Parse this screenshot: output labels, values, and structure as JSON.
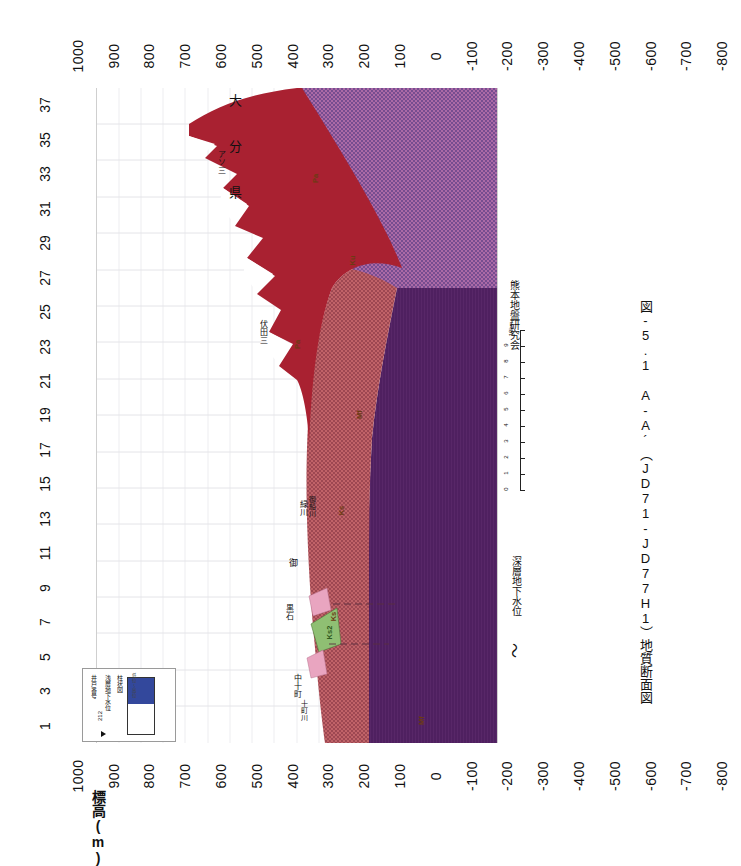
{
  "figure": {
    "caption": "図-5.1  A-A´（JD71-JD77H1）地質断面図",
    "organization": "熊本地盤研究会",
    "prefecture_label": "大 分 県",
    "y_axis_title": "標高(m)",
    "groundwater_label": "深層地下水位",
    "groundwater_symbol": "〜"
  },
  "chart_data": {
    "type": "area",
    "title": "図-5.1  A-A´（JD71-JD77H1）地質断面図",
    "xlabel": "",
    "ylabel": "標高(m)",
    "ylim": [
      -800,
      1000
    ],
    "xlim": [
      1,
      37
    ],
    "grid": true,
    "legend_position": "inside-lower-left",
    "x_tick_labels": [
      "1",
      "3",
      "5",
      "7",
      "9",
      "11",
      "13",
      "15",
      "17",
      "19",
      "21",
      "23",
      "25",
      "27",
      "29",
      "31",
      "33",
      "35",
      "37"
    ],
    "y_tick_labels": [
      "1000",
      "900",
      "800",
      "700",
      "600",
      "500",
      "400",
      "300",
      "200",
      "100",
      "0",
      "-100",
      "-200",
      "-300",
      "-400",
      "-500",
      "-600",
      "-700",
      "-800"
    ],
    "series": [
      {
        "name": "ground-surface",
        "note": "地表面（標高プロファイル）",
        "x": [
          1,
          2,
          3,
          4,
          5,
          6,
          7,
          8,
          9,
          10,
          11,
          12,
          13,
          14,
          15,
          16,
          17,
          18,
          19,
          20,
          21,
          22,
          23,
          24,
          25,
          26,
          27,
          28
        ],
        "values": [
          35,
          60,
          95,
          120,
          150,
          120,
          95,
          200,
          260,
          210,
          175,
          240,
          330,
          300,
          260,
          320,
          380,
          340,
          300,
          330,
          430,
          400,
          350,
          430,
          480,
          420,
          640,
          720
        ]
      },
      {
        "name": "Ks-base",
        "note": "砥川溶岩／阿蘇火砕流下限",
        "x": [
          1,
          4,
          7,
          10,
          13,
          16,
          19,
          22,
          25,
          27
        ],
        "values": [
          -180,
          -200,
          -205,
          -195,
          -160,
          -100,
          -20,
          120,
          330,
          560
        ]
      },
      {
        "name": "basement-top",
        "note": "基盤岩上面",
        "x": [
          1,
          5,
          9,
          13,
          16,
          19,
          22,
          25,
          27
        ],
        "values": [
          -230,
          -235,
          -230,
          -210,
          -150,
          -40,
          140,
          360,
          600
        ]
      }
    ],
    "units": [
      {
        "code": "Ks",
        "color": "#bb5a5e",
        "pattern": "dots",
        "description": "阿蘇火砕流堆積物"
      },
      {
        "code": "Ku",
        "color": "#a6609e",
        "pattern": "dots",
        "description": "上位層"
      },
      {
        "code": "Pa",
        "color": "#a92131",
        "pattern": "solid",
        "description": "先阿蘇火山岩類"
      },
      {
        "code": "Mf",
        "color": "#4f2060",
        "pattern": "hatch",
        "description": "基盤岩"
      },
      {
        "code": "Ks2",
        "color": "#8fbf73",
        "pattern": "solid",
        "description": "砥川溶岩"
      },
      {
        "code": "Ah",
        "color": "#e9a5c0",
        "pattern": "solid",
        "description": "沖積層"
      }
    ],
    "annotations": [
      {
        "text": "大 分 県",
        "x": 24,
        "y": 760
      },
      {
        "text": "阿蘇三",
        "x": 24.5,
        "y": 415
      },
      {
        "text": "伏田三",
        "x": 17.6,
        "y": 300
      },
      {
        "text": "緑川",
        "x": 8.9,
        "y": 120
      },
      {
        "text": "御船川",
        "x": 8.4,
        "y": 105
      },
      {
        "text": "御",
        "x": 7.2,
        "y": 70
      },
      {
        "text": "黒石",
        "x": 5.3,
        "y": 110
      },
      {
        "text": "中十町",
        "x": 3.1,
        "y": 70
      },
      {
        "text": "十町川",
        "x": 2.4,
        "y": 55
      },
      {
        "text": "Pa",
        "x": 24.0,
        "y": 390
      },
      {
        "text": "Pa",
        "x": 17.0,
        "y": 265
      },
      {
        "text": "Ku",
        "x": 21.5,
        "y": 30
      },
      {
        "text": "Mf",
        "x": 14.5,
        "y": -60
      },
      {
        "text": "Ks",
        "x": 9.6,
        "y": 60
      },
      {
        "text": "Ks",
        "x": 5.6,
        "y": -80
      },
      {
        "text": "Mf",
        "x": 1.6,
        "y": -230
      },
      {
        "text": "カラ",
        "x": 7.1,
        "y": 30
      },
      {
        "text": "Ks2",
        "x": 6.9,
        "y": 25
      }
    ]
  },
  "scalebar": {
    "unit": "km",
    "ticks": [
      "0",
      "1",
      "2",
      "3",
      "4",
      "5",
      "6",
      "7",
      "8",
      "9",
      "10km"
    ]
  },
  "legend": {
    "title_1": "井戸番号",
    "title_2": "浅層地下水位",
    "title_3": "柱状図",
    "well_number": "212",
    "bar_caption": "低位〜高位",
    "fill_color": "#33489c"
  }
}
